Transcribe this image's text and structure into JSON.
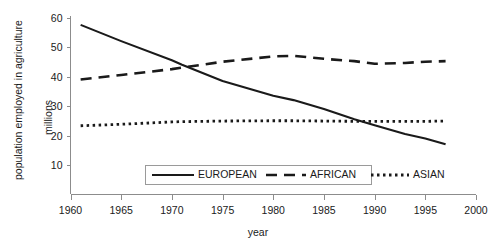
{
  "chart_data": {
    "type": "line",
    "title": "",
    "xlabel": "year",
    "ylabel": "population employed in agriculture millions",
    "ylabel_line1": "population employed in agriculture",
    "ylabel_line2": "millions",
    "xlim": [
      1960,
      2000
    ],
    "ylim": [
      0,
      60
    ],
    "grid": false,
    "legend_position": "bottom-center",
    "xticks": [
      1960,
      1965,
      1970,
      1975,
      1980,
      1985,
      1990,
      1995,
      2000
    ],
    "xtick_labels": [
      "1960",
      "1965",
      "1970",
      "1975",
      "1980",
      "1985",
      "1990",
      "1995",
      "2000"
    ],
    "yticks": [
      10,
      20,
      30,
      40,
      50,
      60
    ],
    "ytick_labels": [
      "10",
      "20",
      "30",
      "40",
      "50",
      "60"
    ],
    "x": [
      1961,
      1965,
      1970,
      1971,
      1975,
      1980,
      1982,
      1985,
      1988,
      1990,
      1993,
      1995,
      1997
    ],
    "series": [
      {
        "name": "EUROPEAN",
        "style": "solid",
        "values": [
          57.5,
          52.0,
          45.5,
          44.0,
          38.5,
          33.5,
          32.0,
          29.0,
          25.5,
          23.5,
          20.5,
          19.0,
          17.0
        ]
      },
      {
        "name": "AFRICAN",
        "style": "dashed",
        "values": [
          39.0,
          40.5,
          42.5,
          43.0,
          45.0,
          46.8,
          47.0,
          46.0,
          45.2,
          44.3,
          44.6,
          45.0,
          45.2
        ]
      },
      {
        "name": "ASIAN",
        "style": "dotted",
        "values": [
          23.3,
          23.8,
          24.6,
          24.7,
          24.9,
          25.0,
          25.0,
          24.9,
          24.8,
          24.8,
          24.8,
          24.8,
          24.9
        ]
      }
    ]
  },
  "legend": {
    "items": [
      {
        "label": "EUROPEAN",
        "style": "solid"
      },
      {
        "label": "AFRICAN",
        "style": "dashed"
      },
      {
        "label": "ASIAN",
        "style": "dotted"
      }
    ]
  },
  "axes": {
    "x_title": "year",
    "y_title_line1": "population employed in agriculture",
    "y_title_line2": "millions"
  }
}
